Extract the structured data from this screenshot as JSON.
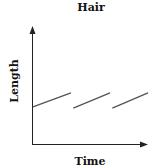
{
  "chart_data": {
    "type": "line",
    "title": "Hair",
    "xlabel": "Time",
    "ylabel": "Length",
    "grid": false,
    "legend": null,
    "axis_ticks": false,
    "series": [
      {
        "name": "segment-1",
        "x": [
          0.0,
          0.33
        ],
        "y": [
          0.32,
          0.44
        ]
      },
      {
        "name": "segment-2",
        "x": [
          0.35,
          0.67
        ],
        "y": [
          0.31,
          0.44
        ]
      },
      {
        "name": "segment-3",
        "x": [
          0.69,
          1.0
        ],
        "y": [
          0.31,
          0.44
        ]
      }
    ],
    "xlim": [
      0,
      1
    ],
    "ylim": [
      0,
      1
    ]
  },
  "colors": {
    "line": "#555555",
    "axis": "#222222"
  }
}
